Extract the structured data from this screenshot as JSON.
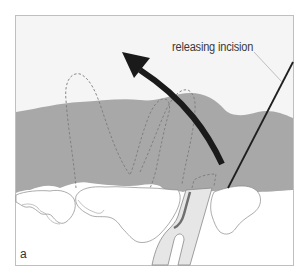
{
  "figure": {
    "panel_label": "a",
    "annotation": "releasing incision",
    "colors": {
      "background": "#f4f4f4",
      "tissue_gray": "#a6a6a6",
      "bone_white": "#ffffff",
      "instrument_fill": "#e6e6e6",
      "arrow": "#1a1a1a",
      "frame": "#bdbdbd"
    },
    "elements": [
      {
        "name": "gingival-flap",
        "description": "gray soft tissue band"
      },
      {
        "name": "bone-contour",
        "description": "white alveolar bone crest"
      },
      {
        "name": "direction-arrow",
        "description": "curved black arrow pointing up-left"
      },
      {
        "name": "releasing-incision-line",
        "description": "diagonal black line at right"
      },
      {
        "name": "instrument",
        "description": "forked elevator instrument"
      },
      {
        "name": "dashed-outlines",
        "description": "dashed loop outlines of papillae"
      }
    ]
  }
}
